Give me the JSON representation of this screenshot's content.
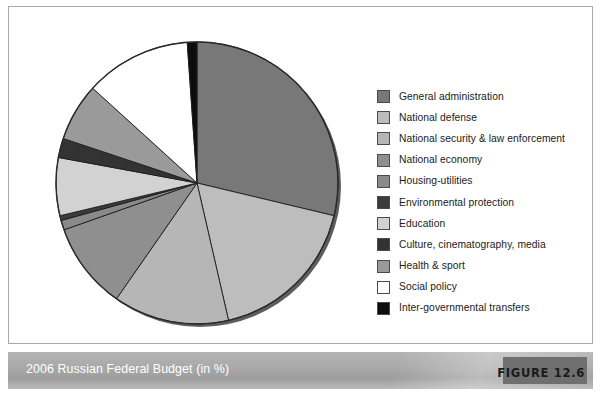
{
  "figure": {
    "caption": "2006 Russian Federal Budget (in %)",
    "tag_label": "FIGURE 12.6"
  },
  "chart_data": {
    "type": "pie",
    "title": "2006 Russian Federal Budget (in %)",
    "unit": "%",
    "start_angle_deg": 0,
    "direction": "clockwise",
    "legend_position": "right",
    "grid": false,
    "categories": [
      "General administration",
      "National defense",
      "National security & law enforcement",
      "National economy",
      "Housing-utilities",
      "Environmental protection",
      "Education",
      "Culture, cinematography, media",
      "Health & sport",
      "Social policy",
      "Inter-governmental transfers"
    ],
    "values": [
      26,
      16,
      12,
      9,
      1,
      0.5,
      6,
      2,
      6,
      11,
      1
    ],
    "colors": [
      "#787878",
      "#bdbdbd",
      "#b6b6b6",
      "#8f8f8f",
      "#8a8a8a",
      "#3c3c3c",
      "#d2d2d2",
      "#333333",
      "#9a9a9a",
      "#ffffff",
      "#0d0d0d"
    ]
  }
}
